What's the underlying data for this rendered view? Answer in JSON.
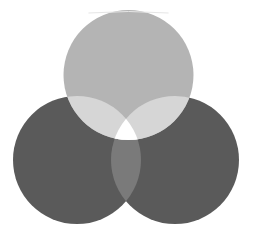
{
  "diagram": {
    "type": "three-circle-venn",
    "width": 257,
    "height": 241,
    "background": "#ffffff",
    "circles": [
      {
        "id": "top",
        "cx": 128.5,
        "cy": 75,
        "r": 65,
        "color": "#b4b4b4"
      },
      {
        "id": "left",
        "cx": 77,
        "cy": 160,
        "r": 64,
        "color": "#5a5a5a"
      },
      {
        "id": "right",
        "cx": 175,
        "cy": 160,
        "r": 64,
        "color": "#5a5a5a"
      }
    ],
    "overlaps": {
      "top_left": "#d6d6d6",
      "top_right": "#d6d6d6",
      "left_right": "#7a7a7a",
      "center": "#ffffff"
    },
    "top_edge_highlight": "#e6e6e6"
  }
}
